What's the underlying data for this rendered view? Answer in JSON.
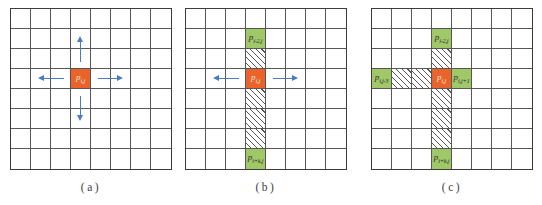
{
  "figure": {
    "grid": {
      "rows": 8,
      "cols": 8
    },
    "colors": {
      "center_fill": "#E9632A",
      "neighbor_fill": "#A1C868",
      "hatch_line": "#565656",
      "arrow": "#4A7CC5",
      "grid_line": "#565656",
      "grid_border": "#3C3C3C",
      "center_label": "#F6E8DC",
      "neighbor_label": "#2F2F2F",
      "caption": "#3D3D3D"
    }
  },
  "panels": [
    {
      "id": "a",
      "caption": "(a)",
      "cells": [
        {
          "row": 4,
          "col": 4,
          "type": "center",
          "label": "p",
          "sub": "i,j"
        }
      ],
      "arrows": [
        "up",
        "down",
        "left",
        "right"
      ]
    },
    {
      "id": "b",
      "caption": "(b)",
      "cells": [
        {
          "row": 2,
          "col": 4,
          "type": "neighbor",
          "label": "p",
          "sub": "i-2,j"
        },
        {
          "row": 3,
          "col": 4,
          "type": "hatch"
        },
        {
          "row": 4,
          "col": 4,
          "type": "center",
          "label": "p",
          "sub": "i,j"
        },
        {
          "row": 5,
          "col": 4,
          "type": "hatch"
        },
        {
          "row": 6,
          "col": 4,
          "type": "hatch"
        },
        {
          "row": 7,
          "col": 4,
          "type": "hatch"
        },
        {
          "row": 8,
          "col": 4,
          "type": "neighbor",
          "label": "p",
          "sub": "i+k,j"
        }
      ],
      "arrows": [
        "left",
        "right"
      ]
    },
    {
      "id": "c",
      "caption": "(c)",
      "cells": [
        {
          "row": 2,
          "col": 4,
          "type": "neighbor",
          "label": "p",
          "sub": "i-2,j"
        },
        {
          "row": 3,
          "col": 4,
          "type": "hatch"
        },
        {
          "row": 4,
          "col": 1,
          "type": "neighbor",
          "label": "p",
          "sub": "i,j-3"
        },
        {
          "row": 4,
          "col": 2,
          "type": "hatch"
        },
        {
          "row": 4,
          "col": 3,
          "type": "hatch"
        },
        {
          "row": 4,
          "col": 4,
          "type": "center",
          "label": "p",
          "sub": "i,j"
        },
        {
          "row": 4,
          "col": 5,
          "type": "neighbor",
          "label": "p",
          "sub": "i,j+1"
        },
        {
          "row": 5,
          "col": 4,
          "type": "hatch"
        },
        {
          "row": 6,
          "col": 4,
          "type": "hatch"
        },
        {
          "row": 7,
          "col": 4,
          "type": "hatch"
        },
        {
          "row": 8,
          "col": 4,
          "type": "neighbor",
          "label": "p",
          "sub": "i+k,j"
        }
      ],
      "arrows": []
    }
  ]
}
